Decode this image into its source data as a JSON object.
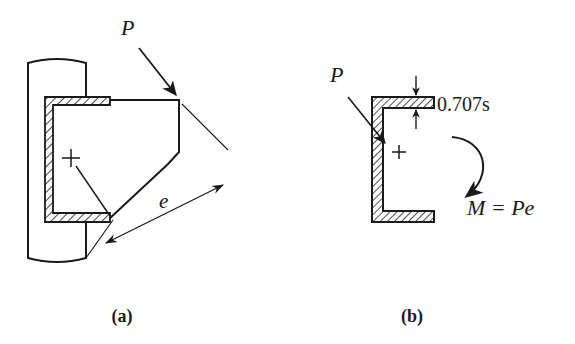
{
  "figure": {
    "background_color": "#ffffff",
    "line_color": "#1a1a1a",
    "hatch_color": "#1a1a1a",
    "panels": [
      {
        "id": "panel-a",
        "caption": "(a)",
        "description": "Plan view of welded bracket plate attached to a column by a C-shaped fillet weld group",
        "labels": {
          "load": "P",
          "eccentricity": "e"
        }
      },
      {
        "id": "panel-b",
        "caption": "(b)",
        "description": "Effective throat area of the C-shaped weld group with equivalent force and moment",
        "labels": {
          "load": "P",
          "throat": "0.707s",
          "moment": "M = Pe"
        }
      }
    ]
  }
}
